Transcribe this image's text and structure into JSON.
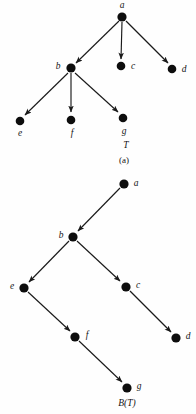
{
  "figure": {
    "background_color": "#fefefe",
    "node_color": "#0d0d0d",
    "edge_color": "#1a1a1a",
    "panels": [
      {
        "id": "panel-a",
        "name": "general-tree",
        "tree_name": "T",
        "caption": "(a)",
        "tree_name_x": 126,
        "tree_name_y": 148,
        "caption_x": 124,
        "caption_y": 163,
        "nodes": [
          {
            "id": "a",
            "label": "a",
            "x": 122,
            "y": 17,
            "r": 4.6,
            "label_x": 122,
            "label_y": 8,
            "label_anchor": "middle"
          },
          {
            "id": "b",
            "label": "b",
            "x": 71,
            "y": 68,
            "r": 4.6,
            "label_x": 58,
            "label_y": 69,
            "label_anchor": "middle"
          },
          {
            "id": "c",
            "label": "c",
            "x": 121,
            "y": 66,
            "r": 4.3,
            "label_x": 133,
            "label_y": 69,
            "label_anchor": "middle"
          },
          {
            "id": "d",
            "label": "d",
            "x": 172,
            "y": 69,
            "r": 4.3,
            "label_x": 184,
            "label_y": 72,
            "label_anchor": "middle"
          },
          {
            "id": "e",
            "label": "e",
            "x": 20,
            "y": 121,
            "r": 4.3,
            "label_x": 20,
            "label_y": 136,
            "label_anchor": "middle"
          },
          {
            "id": "f",
            "label": "f",
            "x": 71,
            "y": 120,
            "r": 4.3,
            "label_x": 72,
            "label_y": 136,
            "label_anchor": "middle"
          },
          {
            "id": "g",
            "label": "g",
            "x": 123,
            "y": 118,
            "r": 4.3,
            "label_x": 124,
            "label_y": 134,
            "label_anchor": "middle"
          }
        ],
        "edges": [
          {
            "from": "a",
            "to": "b"
          },
          {
            "from": "a",
            "to": "c"
          },
          {
            "from": "a",
            "to": "d"
          },
          {
            "from": "b",
            "to": "e"
          },
          {
            "from": "b",
            "to": "f"
          },
          {
            "from": "b",
            "to": "g"
          }
        ]
      },
      {
        "id": "panel-b",
        "name": "binary-tree",
        "caption": "B(T)",
        "caption_italic_part": "B",
        "caption_paren_open": "(",
        "caption_inner": "T",
        "caption_paren_close": ")",
        "caption_x": 127,
        "caption_y": 406,
        "nodes": [
          {
            "id": "a",
            "label": "a",
            "x": 124,
            "y": 184,
            "r": 4.6,
            "label_x": 136,
            "label_y": 186,
            "label_anchor": "middle"
          },
          {
            "id": "b",
            "label": "b",
            "x": 73,
            "y": 237,
            "r": 4.6,
            "label_x": 61,
            "label_y": 238,
            "label_anchor": "middle"
          },
          {
            "id": "e",
            "label": "e",
            "x": 24,
            "y": 288,
            "r": 4.6,
            "label_x": 12,
            "label_y": 289,
            "label_anchor": "middle"
          },
          {
            "id": "c",
            "label": "c",
            "x": 126,
            "y": 287,
            "r": 4.6,
            "label_x": 138,
            "label_y": 288,
            "label_anchor": "middle"
          },
          {
            "id": "f",
            "label": "f",
            "x": 75,
            "y": 337,
            "r": 4.6,
            "label_x": 87,
            "label_y": 338,
            "label_anchor": "middle"
          },
          {
            "id": "d",
            "label": "d",
            "x": 176,
            "y": 338,
            "r": 4.6,
            "label_x": 188,
            "label_y": 339,
            "label_anchor": "middle"
          },
          {
            "id": "g",
            "label": "g",
            "x": 127,
            "y": 388,
            "r": 4.6,
            "label_x": 139,
            "label_y": 389,
            "label_anchor": "middle"
          }
        ],
        "edges": [
          {
            "from": "a",
            "to": "b"
          },
          {
            "from": "b",
            "to": "e"
          },
          {
            "from": "b",
            "to": "c"
          },
          {
            "from": "e",
            "to": "f"
          },
          {
            "from": "c",
            "to": "d"
          },
          {
            "from": "f",
            "to": "g"
          }
        ]
      }
    ]
  }
}
